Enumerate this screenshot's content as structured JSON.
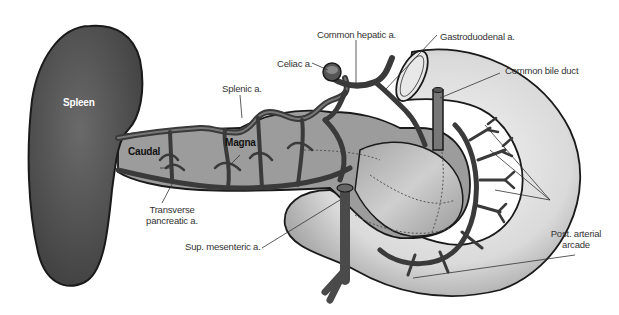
{
  "diagram": {
    "type": "anatomical-illustration",
    "colors": {
      "spleen": "#505050",
      "pancreas": "#9a9a9a",
      "duodenum": "#dcdcdc",
      "artery": "#3a3a3a",
      "outline": "#1a1a1a",
      "leader": "#333333"
    },
    "labels": {
      "spleen": "Spleen",
      "caudal": "Caudal",
      "magna": "Magna",
      "splenic": "Splenic a.",
      "celiac": "Celiac a.",
      "common_hepatic": "Common hepatic a.",
      "gastroduodenal": "Gastroduodenal a.",
      "common_bile_duct": "Common bile duct",
      "transverse_line1": "Transverse",
      "transverse_line2": "pancreatic a.",
      "sup_mesenteric": "Sup. mesenteric a.",
      "post_arterial_line1": "Post. arterial",
      "post_arterial_line2": "arcade"
    }
  }
}
